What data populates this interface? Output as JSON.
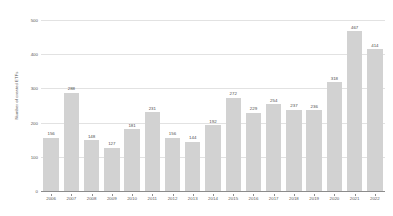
{
  "chart_data": {
    "type": "bar",
    "title": "",
    "xlabel": "",
    "ylabel": "Number of created ETFs",
    "categories": [
      "2006",
      "2007",
      "2008",
      "2009",
      "2010",
      "2011",
      "2012",
      "2013",
      "2014",
      "2015",
      "2016",
      "2017",
      "2018",
      "2019",
      "2020",
      "2021",
      "2022"
    ],
    "values": [
      156,
      288,
      148,
      127,
      181,
      231,
      156,
      144,
      192,
      272,
      229,
      254,
      237,
      236,
      318,
      467,
      414
    ],
    "ylim": [
      0,
      500
    ],
    "yticks": [
      0,
      100,
      200,
      300,
      400,
      500
    ],
    "ytick_labels": [
      "0",
      "100",
      "200",
      "300",
      "400",
      "500"
    ],
    "grid": true,
    "legend": "none",
    "bar_color": "#d2d2d2",
    "gridline_color": "#e2e2e2",
    "axis_color": "#8c8c8c",
    "label_color": "#595959",
    "background": "#ffffff",
    "data_labels": [
      "156",
      "288",
      "148",
      "127",
      "181",
      "231",
      "156",
      "144",
      "192",
      "272",
      "229",
      "254",
      "237",
      "236",
      "318",
      "467",
      "414"
    ]
  }
}
